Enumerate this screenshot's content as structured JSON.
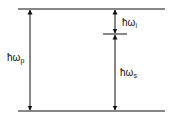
{
  "diagram": {
    "levels": [
      "upper-level",
      "intermediate-level",
      "lower-level"
    ],
    "arrows": [
      {
        "name": "pump",
        "symbol": "ħω",
        "subscript": "p"
      },
      {
        "name": "idler",
        "symbol": "ħω",
        "subscript": "i"
      },
      {
        "name": "signal",
        "symbol": "ħω",
        "subscript": "s"
      }
    ],
    "colors": {
      "line": "#111111",
      "background": "#ffffff"
    }
  }
}
